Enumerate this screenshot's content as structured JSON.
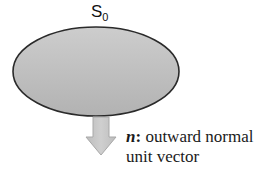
{
  "diagram": {
    "surface": {
      "label": "S",
      "label_subscript": "0",
      "fill_top": "#cbcbcb",
      "fill_bottom": "#b3b3b3",
      "stroke": "#2a2a2a"
    },
    "normal_arrow": {
      "fill": "#c6c6c6",
      "stroke": "#a9a9a9",
      "direction": "down"
    },
    "caption": {
      "symbol": "n",
      "separator": ":",
      "line1_text": " outward normal",
      "line2_text": "unit vector"
    }
  }
}
